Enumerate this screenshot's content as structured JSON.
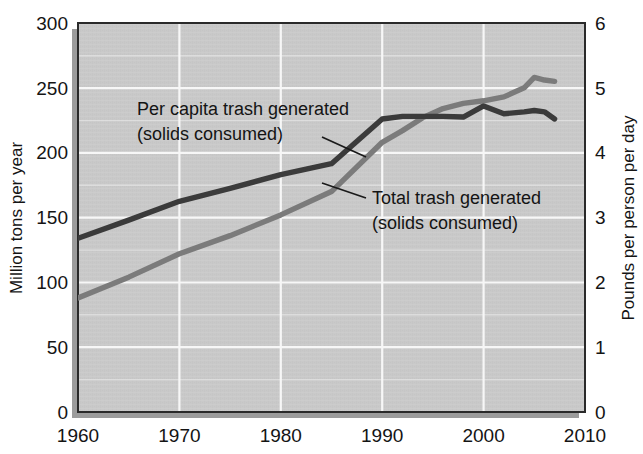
{
  "chart_data": {
    "type": "line",
    "title": "",
    "xlabel": "",
    "x": [
      1960,
      1965,
      1970,
      1975,
      1980,
      1985,
      1990,
      1992,
      1994,
      1996,
      1998,
      2000,
      2002,
      2004,
      2005,
      2006,
      2007
    ],
    "xlim": [
      1960,
      2010
    ],
    "x_ticks": [
      "1960",
      "1970",
      "1980",
      "1990",
      "2000",
      "2010"
    ],
    "x_tick_values": [
      1960,
      1970,
      1980,
      1990,
      2000,
      2010
    ],
    "grid": true,
    "grid_minor": true,
    "legend": "inline annotations",
    "axes": [
      {
        "side": "left",
        "label": "Million tons per year",
        "lim": [
          0,
          300
        ],
        "ticks": [
          "0",
          "50",
          "100",
          "150",
          "200",
          "250",
          "300"
        ],
        "tick_values": [
          0,
          50,
          100,
          150,
          200,
          250,
          300
        ],
        "minor_step": 25
      },
      {
        "side": "right",
        "label": "Pounds per person per day",
        "lim": [
          0,
          6
        ],
        "ticks": [
          "0",
          "1",
          "2",
          "3",
          "4",
          "5",
          "6"
        ],
        "tick_values": [
          0,
          1,
          2,
          3,
          4,
          5,
          6
        ],
        "minor_step": 0.5
      }
    ],
    "series": [
      {
        "name": "Per capita trash generated (solids consumed)",
        "axis": "right",
        "units": "pounds per person per day",
        "color": "#3b3b3b",
        "values": [
          2.68,
          2.96,
          3.25,
          3.45,
          3.66,
          3.83,
          4.52,
          4.56,
          4.56,
          4.56,
          4.55,
          4.72,
          4.6,
          4.63,
          4.65,
          4.63,
          4.52
        ]
      },
      {
        "name": "Total trash generated (solids consumed)",
        "axis": "left",
        "units": "million tons per year",
        "color": "#7b7b7b",
        "values": [
          88,
          104,
          122,
          136,
          152,
          170,
          208,
          217,
          227,
          234,
          238,
          240,
          243,
          250,
          258,
          256,
          255
        ]
      }
    ],
    "annotations": [
      {
        "id": "per-capita",
        "line1": "Per capita trash generated",
        "line2": "(solids consumed)",
        "series": "Per capita trash generated (solids consumed)"
      },
      {
        "id": "total-trash",
        "line1": "Total trash generated",
        "line2": "(solids consumed)",
        "series": "Total trash generated (solids consumed)"
      }
    ],
    "colors": {
      "plot_background": "#c9c9c9",
      "gridline": "#f2f2f2",
      "dark_series": "#3b3b3b",
      "gray_series": "#7b7b7b",
      "text": "#141414"
    }
  }
}
